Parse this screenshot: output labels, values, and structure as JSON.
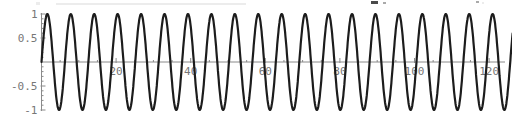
{
  "page": {
    "background": "#ffffff"
  },
  "chart_data": {
    "type": "line",
    "title": "",
    "subtitle": "",
    "function": "sin(x)",
    "series": [
      {
        "name": "sin(x)",
        "expression": "Math.sin"
      }
    ],
    "x_range": [
      0,
      126.3
    ],
    "y_range": [
      -1,
      1
    ],
    "xlabel": "",
    "ylabel": "",
    "grid": false,
    "legend": false,
    "x_ticks": [
      {
        "value": 20,
        "label": "20"
      },
      {
        "value": 40,
        "label": "40"
      },
      {
        "value": 60,
        "label": "60"
      },
      {
        "value": 80,
        "label": "80"
      },
      {
        "value": 100,
        "label": "100"
      },
      {
        "value": 120,
        "label": "120"
      }
    ],
    "x_minor_step": 5,
    "y_ticks": [
      {
        "value": 1,
        "label": "1"
      },
      {
        "value": 0.5,
        "label": "0.5"
      },
      {
        "value": -0.5,
        "label": "-0.5"
      },
      {
        "value": -1,
        "label": "-1"
      }
    ],
    "y_minor_step": 0.1,
    "colors": {
      "curve": "#1c1c1c",
      "axis": "#8a8a8a",
      "tick": "#8a8a8a",
      "label": "#777777"
    },
    "layout": {
      "width": 512,
      "height": 122,
      "origin_px": [
        41.5,
        62
      ],
      "px_per_x_unit": 3.73,
      "px_per_y_unit": 48,
      "x_axis_end_px": 505,
      "y_axis_top_px": 13,
      "y_axis_bottom_px": 111,
      "major_tick_len": 4,
      "minor_tick_len": 2,
      "curve_stroke_width": 2.2,
      "sample_step": 0.1
    }
  }
}
